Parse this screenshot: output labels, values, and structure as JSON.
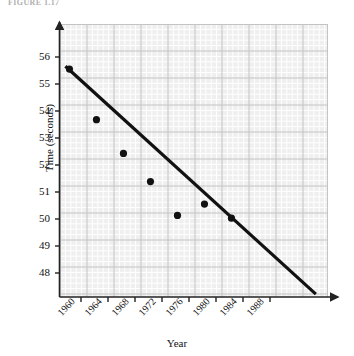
{
  "figure": {
    "caption": "FIGURE 1.17"
  },
  "chart_data": {
    "type": "scatter",
    "title": "",
    "xlabel": "Year",
    "ylabel": "Time (seconds)",
    "x": [
      1960,
      1964,
      1968,
      1972,
      1976,
      1980,
      1984
    ],
    "values": [
      55.2,
      53.4,
      52.2,
      51.2,
      50.0,
      50.4,
      49.9
    ],
    "series": [
      {
        "name": "Winning time",
        "x": [
          1960,
          1964,
          1968,
          1972,
          1976,
          1980,
          1984
        ],
        "values": [
          55.2,
          53.4,
          52.2,
          51.2,
          50.0,
          50.4,
          49.9
        ]
      },
      {
        "name": "Trend line",
        "type": "line",
        "x": [
          1959.4,
          1996.5
        ],
        "values": [
          55.3,
          47.2
        ]
      }
    ],
    "xticks": [
      1960,
      1964,
      1968,
      1972,
      1976,
      1980,
      1984,
      1988
    ],
    "xticklabels": [
      "1960",
      "1964",
      "1968",
      "1972",
      "1976",
      "1980",
      "1984",
      "1988"
    ],
    "yticks": [
      48,
      49,
      50,
      51,
      52,
      53,
      54,
      55,
      56
    ],
    "yticklabels": [
      "48",
      "49",
      "50",
      "51",
      "52",
      "53",
      "54",
      "55",
      "56"
    ],
    "xlim": [
      1958.6,
      1998.3
    ],
    "ylim": [
      47.1,
      56.8
    ],
    "grid": true,
    "legend": "none",
    "colors": {
      "plot_background": "#efefef",
      "grid_minor": "#ffffff",
      "grid_major": "#c8c8c8",
      "point": "#111111",
      "trend_line": "#111111",
      "axis": "#333333"
    }
  }
}
